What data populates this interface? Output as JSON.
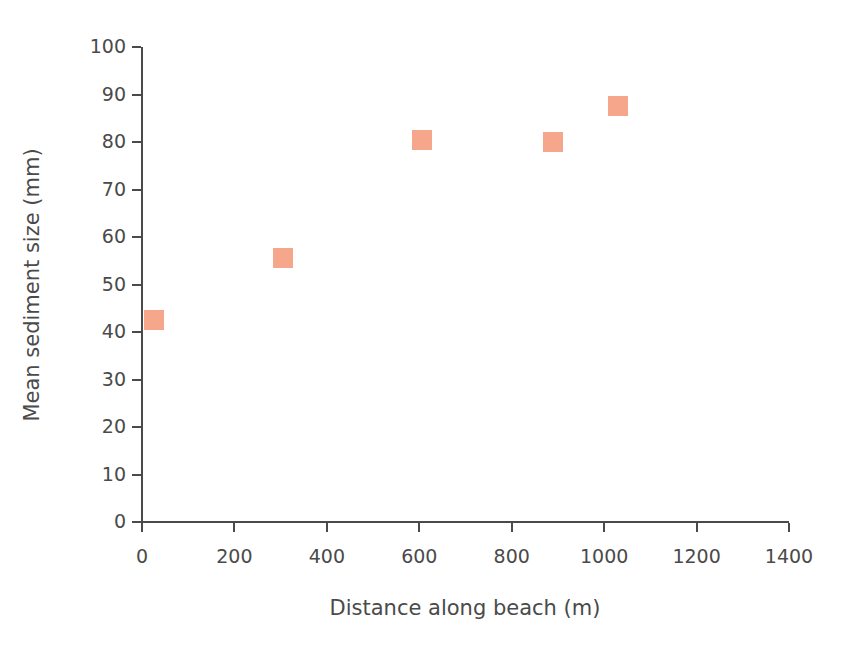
{
  "chart_data": {
    "type": "scatter",
    "title": "",
    "xlabel": "Distance along beach (m)",
    "ylabel": "Mean sediment size (mm)",
    "xlim": [
      0,
      1400
    ],
    "ylim": [
      0,
      100
    ],
    "xticks": [
      0,
      200,
      400,
      600,
      800,
      1000,
      1200,
      1400
    ],
    "yticks": [
      0,
      10,
      20,
      30,
      40,
      50,
      60,
      70,
      80,
      90,
      100
    ],
    "xtick_labels": [
      "0",
      "200",
      "400",
      "600",
      "800",
      "1000",
      "1200",
      "1400"
    ],
    "ytick_labels": [
      "0",
      "10",
      "20",
      "30",
      "40",
      "50",
      "60",
      "70",
      "80",
      "90",
      "100"
    ],
    "grid": false,
    "legend": false,
    "marker_shape": "square",
    "marker_color": "#f5a184",
    "axis_color": "#4a4a4a",
    "background_color": "#ffffff",
    "series": [
      {
        "name": "Mean sediment size",
        "points": [
          {
            "x": 25,
            "y": 42.5
          },
          {
            "x": 305,
            "y": 55.5
          },
          {
            "x": 605,
            "y": 80.5
          },
          {
            "x": 890,
            "y": 80.0
          },
          {
            "x": 1030,
            "y": 87.5
          }
        ]
      }
    ]
  }
}
